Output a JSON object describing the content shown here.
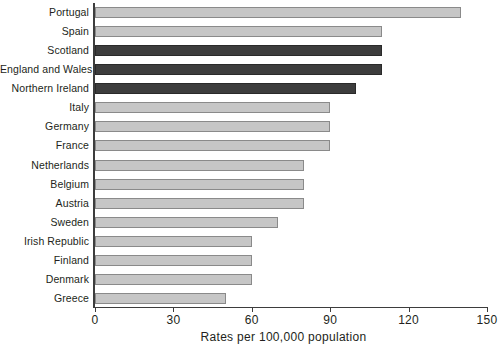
{
  "chart_data": {
    "type": "bar",
    "orientation": "horizontal",
    "title": "",
    "xlabel": "Rates per 100,000 population",
    "ylabel": "",
    "xlim": [
      0,
      150
    ],
    "xticks": [
      0,
      30,
      60,
      90,
      120,
      150
    ],
    "xtick_labels": [
      "0",
      "30",
      "60",
      "90",
      "120",
      "150"
    ],
    "grid": false,
    "legend": "none",
    "categories": [
      "Portugal",
      "Spain",
      "Scotland",
      "England and Wales",
      "Northern Ireland",
      "Italy",
      "Germany",
      "France",
      "Netherlands",
      "Belgium",
      "Austria",
      "Sweden",
      "Irish Republic",
      "Finland",
      "Denmark",
      "Greece"
    ],
    "values": [
      140,
      110,
      110,
      110,
      100,
      90,
      90,
      90,
      80,
      80,
      80,
      70,
      60,
      60,
      60,
      50
    ],
    "highlighted": [
      "Scotland",
      "England and Wales",
      "Northern Ireland"
    ],
    "colors": {
      "bar_default": "#c6c6c6",
      "bar_highlight": "#3d3d3d",
      "bar_border": "#8a8a8a",
      "axis": "#3d3d3d",
      "text": "#231f20"
    }
  },
  "footer": {
    "cropped_text": ""
  }
}
